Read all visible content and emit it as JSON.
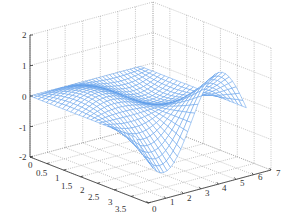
{
  "chart_data": {
    "type": "surface3d",
    "title": "",
    "xlabel": "",
    "ylabel": "",
    "zlabel": "",
    "x_ticks": [
      "0",
      "1",
      "2",
      "3",
      "4",
      "5",
      "6",
      "7"
    ],
    "y_ticks": [
      "0",
      "0.5",
      "1",
      "1.5",
      "2",
      "2.5",
      "3",
      "3.5"
    ],
    "z_ticks": [
      "-2",
      "-1",
      "0",
      "1",
      "2"
    ],
    "xlim": [
      0,
      7
    ],
    "ylim": [
      0,
      3.5
    ],
    "zlim": [
      -2,
      2
    ],
    "grid": true,
    "mesh_color": "#5b9be8",
    "surface_description": "Wireframe mesh surface over x in [0, 2*pi], y in [0, pi]; zero along y=0 edge, ridge peaks near z~1 at x~1.5 and rises to ~1.4 at x~4.7 on far side, dipping to ~-1 near x~4 on near side",
    "sample_points": [
      {
        "x": 0,
        "y": 0,
        "z": 0
      },
      {
        "x": 1.57,
        "y": 1.0,
        "z": 0.8
      },
      {
        "x": 4.7,
        "y": 3.14,
        "z": 1.4
      },
      {
        "x": 4.0,
        "y": 0.5,
        "z": -1.0
      },
      {
        "x": 6.28,
        "y": 3.14,
        "z": 0.3
      }
    ]
  },
  "axes": {
    "z_labels": [
      {
        "text": "2",
        "x": 22,
        "y": 38
      },
      {
        "text": "1",
        "x": 22,
        "y": 69
      },
      {
        "text": "0",
        "x": 22,
        "y": 100
      },
      {
        "text": "-1",
        "x": 19,
        "y": 131
      },
      {
        "text": "-2",
        "x": 19,
        "y": 160
      }
    ],
    "y_labels": [
      {
        "text": "0",
        "x": 28,
        "y": 168
      },
      {
        "text": "0.5",
        "x": 36,
        "y": 176
      },
      {
        "text": "1",
        "x": 55,
        "y": 181
      },
      {
        "text": "1.5",
        "x": 61,
        "y": 189
      },
      {
        "text": "2",
        "x": 80,
        "y": 193
      },
      {
        "text": "2.5",
        "x": 88,
        "y": 200
      },
      {
        "text": "3",
        "x": 108,
        "y": 205
      },
      {
        "text": "3.5",
        "x": 115,
        "y": 212
      }
    ],
    "x_labels": [
      {
        "text": "0",
        "x": 152,
        "y": 212
      },
      {
        "text": "1",
        "x": 170,
        "y": 205
      },
      {
        "text": "2",
        "x": 187,
        "y": 201
      },
      {
        "text": "3",
        "x": 205,
        "y": 196
      },
      {
        "text": "4",
        "x": 222,
        "y": 191
      },
      {
        "text": "5",
        "x": 240,
        "y": 186
      },
      {
        "text": "6",
        "x": 258,
        "y": 180
      },
      {
        "text": "7",
        "x": 276,
        "y": 176
      }
    ]
  }
}
